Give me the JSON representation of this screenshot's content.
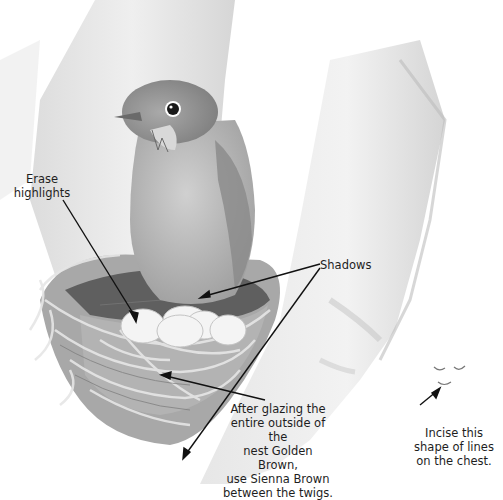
{
  "illustration": {
    "subject": "Bird (thrush) sitting on nest with eggs in tree fork",
    "annotations": {
      "erase_highlights": "Erase\nhighlights",
      "shadows": "Shadows",
      "glazing_note": "After glazing the\nentire outside of the\nnest Golden Brown,\nuse Sienna Brown\nbetween the twigs.",
      "incise_note": "Incise this\nshape of lines\non the chest."
    },
    "colors": {
      "background": "#ffffff",
      "trunk": "#e2e2e2",
      "trunk_shade": "#c9c9c9",
      "bird_body": "#b9b9b9",
      "bird_head": "#8f8f8f",
      "nest": "#9a9a9a",
      "nest_dark": "#5a5a5a",
      "eggs": "#f3f3f3",
      "text": "#1e1e1e",
      "leader_lines": "#111111"
    }
  }
}
